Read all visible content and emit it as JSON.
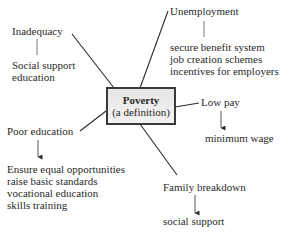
{
  "diagram": {
    "center": {
      "title": "Poverty",
      "subtitle": "(a definition)"
    },
    "branches": [
      {
        "cause": "Inadequacy",
        "connector": "line",
        "remedies": [
          "Social support",
          "education"
        ]
      },
      {
        "cause": "Unemployment",
        "connector": "line",
        "remedies": [
          "secure benefit system",
          "job creation schemes",
          "incentives for employers"
        ]
      },
      {
        "cause": "Low pay",
        "connector": "arrow",
        "remedies": [
          "minimum wage"
        ]
      },
      {
        "cause": "Poor education",
        "connector": "arrow",
        "remedies": [
          "Ensure equal opportunities",
          "raise basic standards",
          "vocational education",
          "skills training"
        ]
      },
      {
        "cause": "Family breakdown",
        "connector": "arrow",
        "remedies": [
          "social support"
        ]
      }
    ],
    "colors": {
      "line": "#2a2a2a",
      "box_border": "#3a3a3a",
      "box_fill_top": "#e6e6e6",
      "box_fill_bottom": "#f3f3f3",
      "text": "#2a2a2a"
    }
  }
}
